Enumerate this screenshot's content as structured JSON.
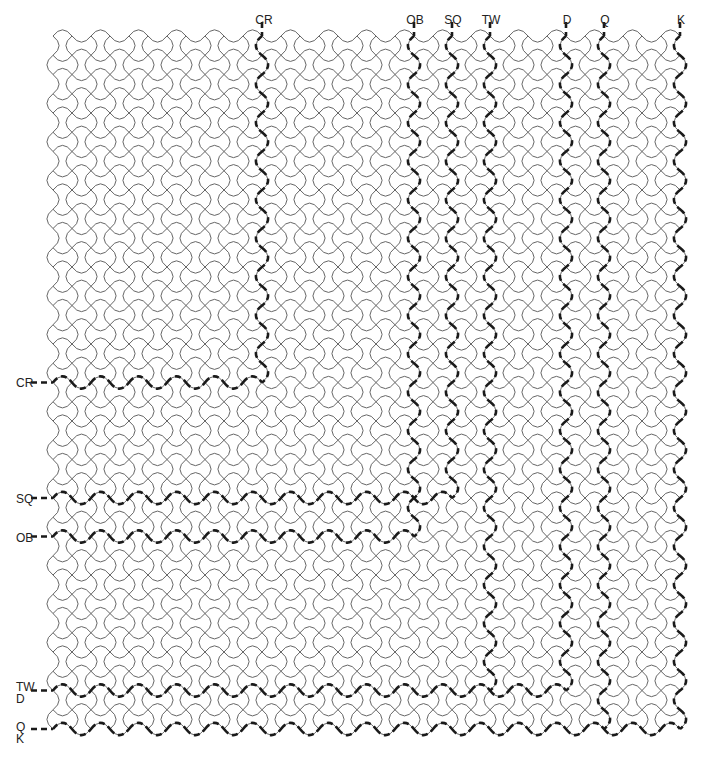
{
  "diagram": {
    "type": "wavy-square-lattice-tessellation",
    "grid": {
      "origin_x": 53,
      "origin_y": 36,
      "step_x": 19,
      "step_y": 19.25,
      "columns": 33,
      "rows": 36,
      "stroke_color": "#555555",
      "dash_color": "#1a1a1a"
    },
    "top_labels": [
      {
        "text": "CR",
        "col": 11,
        "to_row": 18
      },
      {
        "text": "OB",
        "col": 19,
        "to_row": 26
      },
      {
        "text": "SQ",
        "col": 21,
        "to_row": 24
      },
      {
        "text": "TW",
        "col": 23,
        "to_row": 34
      },
      {
        "text": "D",
        "col": 27,
        "to_row": 34
      },
      {
        "text": "Q",
        "col": 29,
        "to_row": 36
      },
      {
        "text": "K",
        "col": 33,
        "to_row": 36
      }
    ],
    "left_labels": [
      {
        "text": "CR",
        "row": 18,
        "to_col": 11
      },
      {
        "text": "SQ",
        "row": 24,
        "to_col": 21
      },
      {
        "text": "OB",
        "row": 26,
        "to_col": 19
      },
      {
        "text": "TW",
        "sub": "D",
        "row": 34,
        "to_col": 27
      },
      {
        "text": "Q",
        "sub": "K",
        "row": 36,
        "to_col": 33
      }
    ]
  }
}
